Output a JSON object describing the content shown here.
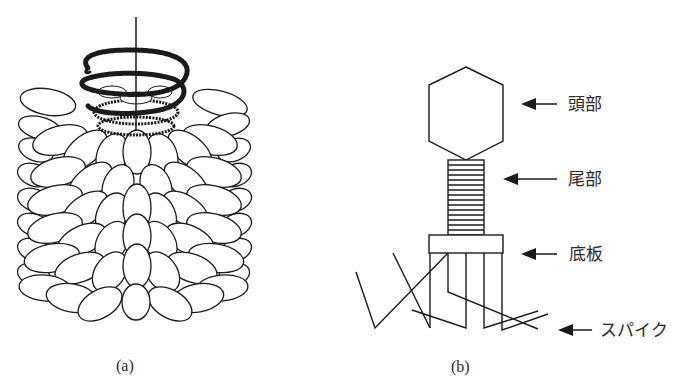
{
  "figure": {
    "panels": [
      {
        "id": "a",
        "caption": "(a)",
        "subject": "rod-shaped virus with helical coil of subunits around a central strand"
      },
      {
        "id": "b",
        "caption": "(b)",
        "subject": "bacteriophage structure",
        "labels": [
          {
            "key": "head",
            "text": "頭部"
          },
          {
            "key": "tail",
            "text": "尾部"
          },
          {
            "key": "baseplate",
            "text": "底板"
          },
          {
            "key": "spike",
            "text": "スパイク"
          }
        ]
      }
    ]
  },
  "colors": {
    "line": "#1a1a1a",
    "text": "#2a2a2a",
    "background": "#ffffff"
  }
}
